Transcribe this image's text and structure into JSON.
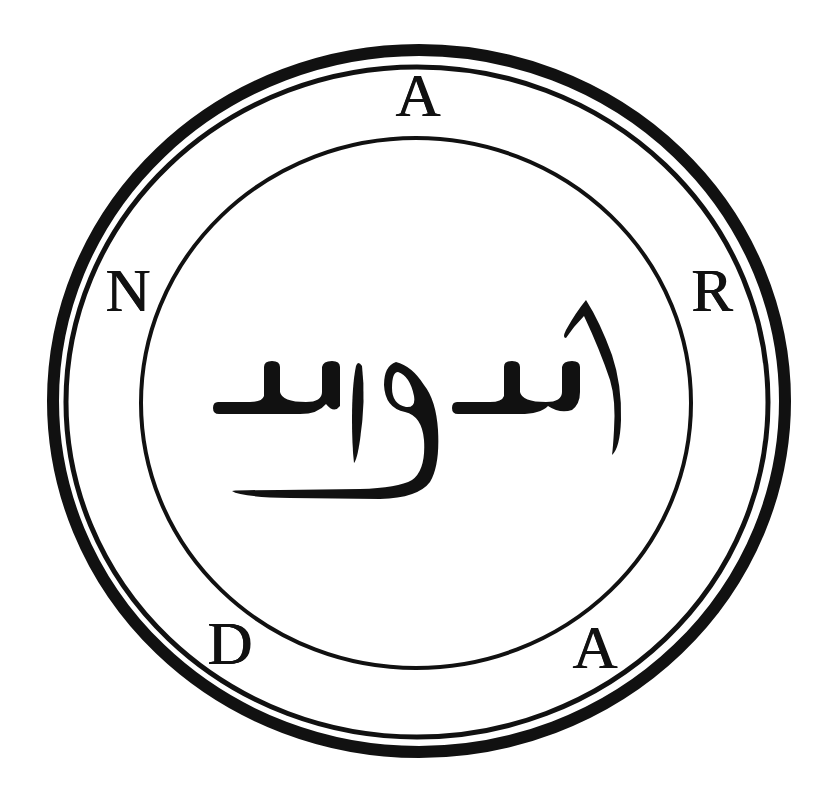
{
  "seal": {
    "name": "Andras sigil seal",
    "background": "#ffffff",
    "ink": "#111111",
    "rings": {
      "outer_thick": {
        "cx": 419,
        "cy": 401,
        "rx": 366,
        "ry": 351,
        "stroke": 12
      },
      "outer_thin": {
        "cx": 417,
        "cy": 402,
        "rx": 351,
        "ry": 335,
        "stroke": 5
      },
      "inner": {
        "cx": 416,
        "cy": 403,
        "rx": 275,
        "ry": 265,
        "stroke": 4
      }
    },
    "letters": [
      {
        "id": "top",
        "char": "A",
        "x": 418,
        "y": 95
      },
      {
        "id": "upper-right",
        "char": "R",
        "x": 712,
        "y": 290
      },
      {
        "id": "lower-right",
        "char": "A",
        "x": 595,
        "y": 647
      },
      {
        "id": "lower-left",
        "char": "D",
        "x": 230,
        "y": 643
      },
      {
        "id": "upper-left",
        "char": "N",
        "x": 128,
        "y": 290
      }
    ],
    "center_script": {
      "description": "Arabic-style calligraphic inscription",
      "text": "اسدواسد"
    }
  }
}
